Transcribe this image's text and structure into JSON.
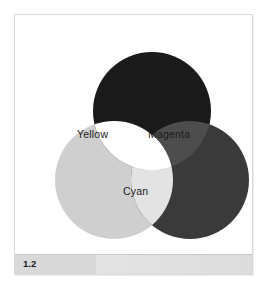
{
  "figure": {
    "caption_number": "1.2",
    "background_color": "#ffffff",
    "frame_border_color": "#d8d8d8",
    "caption_bar_color": "#d9d9d9"
  },
  "diagram": {
    "type": "venn-3-circle",
    "circles": [
      {
        "id": "top",
        "name": "top-circle",
        "cx": 137,
        "cy": 96,
        "r": 59,
        "fill": "#1a1a1a"
      },
      {
        "id": "left",
        "name": "left-circle",
        "cx": 99,
        "cy": 165,
        "r": 59,
        "fill": "#cfcfcf"
      },
      {
        "id": "right",
        "name": "right-circle",
        "cx": 175,
        "cy": 165,
        "r": 59,
        "fill": "#3a3a3a"
      }
    ],
    "regions": [
      {
        "id": "yellow",
        "label": "Yellow",
        "members": [
          "top",
          "left"
        ],
        "fill": "#ffffff"
      },
      {
        "id": "magenta",
        "label": "Magenta",
        "members": [
          "top",
          "right"
        ],
        "fill": "#4d4d4d"
      },
      {
        "id": "cyan",
        "label": "Cyan",
        "members": [
          "left",
          "right"
        ],
        "fill": "#e3e3e3"
      },
      {
        "id": "center",
        "label": "",
        "members": [
          "top",
          "left",
          "right"
        ],
        "fill": "#ffffff"
      }
    ],
    "labels": {
      "yellow": "Yellow",
      "magenta": "Magenta",
      "cyan": "Cyan"
    }
  }
}
